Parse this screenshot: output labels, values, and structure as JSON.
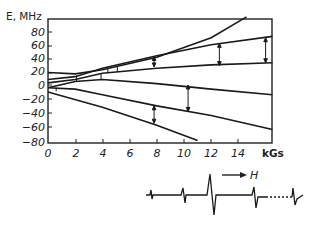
{
  "chart_data": {
    "type": "line",
    "title": "",
    "xlabel": "kGs",
    "ylabel": "E, MHz",
    "xlim": [
      0,
      16.5
    ],
    "ylim": [
      -80,
      100
    ],
    "x_ticks": [
      0,
      2,
      4,
      6,
      8,
      10,
      12,
      14
    ],
    "y_ticks": [
      80,
      60,
      40,
      20,
      0,
      -20,
      -40,
      -60,
      -80
    ],
    "grid": false,
    "legend": null,
    "series": [
      {
        "name": "level-1",
        "points": [
          [
            0,
            18
          ],
          [
            2,
            16
          ],
          [
            4,
            22
          ],
          [
            8,
            40
          ],
          [
            12,
            68
          ],
          [
            14.6,
            98
          ]
        ]
      },
      {
        "name": "level-2",
        "points": [
          [
            0,
            8
          ],
          [
            2,
            12
          ],
          [
            4,
            24
          ],
          [
            8,
            42
          ],
          [
            12,
            58
          ],
          [
            16.5,
            70
          ]
        ]
      },
      {
        "name": "level-3",
        "points": [
          [
            0,
            3
          ],
          [
            2,
            8
          ],
          [
            4,
            17
          ],
          [
            8,
            24
          ],
          [
            12,
            29
          ],
          [
            16.5,
            32
          ]
        ]
      },
      {
        "name": "level-4",
        "points": [
          [
            0,
            -4
          ],
          [
            2,
            5
          ],
          [
            4,
            8
          ],
          [
            8,
            2
          ],
          [
            12,
            -6
          ],
          [
            16.5,
            -14
          ]
        ]
      },
      {
        "name": "level-5",
        "points": [
          [
            0,
            -4
          ],
          [
            2,
            -6
          ],
          [
            4,
            -14
          ],
          [
            8,
            -30
          ],
          [
            12,
            -44
          ],
          [
            16.5,
            -64
          ]
        ]
      },
      {
        "name": "level-6",
        "points": [
          [
            0,
            -10
          ],
          [
            4,
            -32
          ],
          [
            8,
            -58
          ],
          [
            11,
            -80
          ]
        ]
      }
    ],
    "transitions": [
      {
        "x": 0.6,
        "from": -9,
        "to": -4
      },
      {
        "x": 2.1,
        "from": 5,
        "to": 14
      },
      {
        "x": 3.9,
        "from": 8,
        "to": 16
      },
      {
        "x": 4.4,
        "from": 18,
        "to": 24
      },
      {
        "x": 5.1,
        "from": 19,
        "to": 26
      },
      {
        "x": 7.8,
        "from": 26,
        "to": 41
      },
      {
        "x": 7.8,
        "from": -55,
        "to": -30
      },
      {
        "x": 10.3,
        "from": -38,
        "to": 0
      },
      {
        "x": 12.6,
        "from": 28,
        "to": 60
      },
      {
        "x": 16.0,
        "from": 32,
        "to": 68
      }
    ],
    "annotations": [
      "H (field direction arrow)"
    ],
    "spectrum_trace": "EPR derivative absorption spectrum below the diagram, field increasing to the right"
  },
  "labels": {
    "y_axis_title": "E, MHz",
    "x_axis_unit": "kGs",
    "field_arrow_label": "H",
    "y_ticks": [
      "80",
      "60",
      "40",
      "20",
      "0",
      "−20",
      "−40",
      "−60",
      "−80"
    ],
    "x_ticks": [
      "0",
      "2",
      "4",
      "6",
      "8",
      "10",
      "12",
      "14"
    ]
  }
}
